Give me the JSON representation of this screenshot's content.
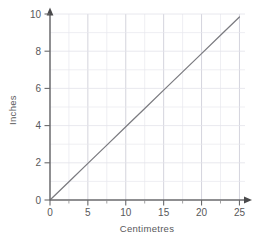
{
  "chart_data": {
    "type": "line",
    "title": "",
    "xlabel": "Centimetres",
    "ylabel": "Inches",
    "xlim": [
      0,
      25
    ],
    "ylim": [
      0,
      10
    ],
    "xticks": [
      0,
      5,
      10,
      15,
      20,
      25
    ],
    "xtick_labels": [
      "0",
      "5",
      "10",
      "15",
      "20",
      "25"
    ],
    "yticks": [
      0,
      2,
      4,
      6,
      8,
      10
    ],
    "ytick_labels": [
      "0",
      "2",
      "4",
      "6",
      "8",
      "10"
    ],
    "x_minor_step": 2.5,
    "y_minor_step": 1,
    "grid": true,
    "legend": "none",
    "series": [
      {
        "name": "Centimetres to inches",
        "x": [
          0,
          25
        ],
        "values": [
          0,
          9.84
        ],
        "points": [
          {
            "x": 0,
            "y": 0
          },
          {
            "x": 2.5,
            "y": 0.98
          },
          {
            "x": 5,
            "y": 1.97
          },
          {
            "x": 7.5,
            "y": 2.95
          },
          {
            "x": 10,
            "y": 3.94
          },
          {
            "x": 12.5,
            "y": 4.92
          },
          {
            "x": 15,
            "y": 5.91
          },
          {
            "x": 17.5,
            "y": 6.89
          },
          {
            "x": 20,
            "y": 7.87
          },
          {
            "x": 22.5,
            "y": 8.86
          },
          {
            "x": 25,
            "y": 9.84
          }
        ],
        "color": "#7b7b80"
      }
    ]
  },
  "colors": {
    "line": "#7b7b80",
    "axis": "#6a6a6c",
    "grid_minor": "#e8e8ee",
    "grid_major": "#c9c9d4",
    "text": "#58585a",
    "background": "#ffffff"
  },
  "axis": {
    "x_arrow": "arrow-right",
    "y_arrow": "arrow-up"
  }
}
